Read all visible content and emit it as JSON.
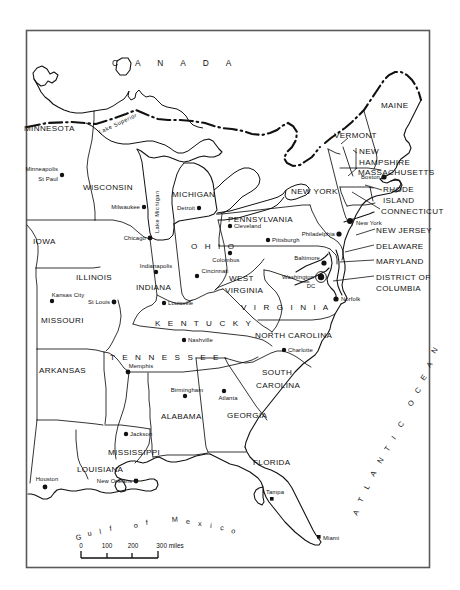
{
  "map": {
    "title": "Eastern United States reference map",
    "frame": {
      "x": 26,
      "y": 30,
      "width": 404,
      "height": 538
    },
    "country_label": "C A N A D A",
    "ocean_label": "ATLANTIC OCEAN",
    "gulf_label": "Gulf of Mexico",
    "colors": {
      "ink": "#111111",
      "frame": "#5a5a5a",
      "background": "#ffffff"
    },
    "lakes": [
      {
        "name": "Lake Superior",
        "label": "Lake Superior"
      },
      {
        "name": "Lake Michigan",
        "label": "Lake Michigan"
      }
    ],
    "states": [
      {
        "label": "MINNESOTA",
        "x": 62,
        "y": 128
      },
      {
        "label": "WISCONSIN",
        "x": 88,
        "y": 185
      },
      {
        "label": "MICHIGAN",
        "x": 172,
        "y": 196
      },
      {
        "label": "IOWA",
        "x": 38,
        "y": 238
      },
      {
        "label": "ILLINOIS",
        "x": 100,
        "y": 278
      },
      {
        "label": "INDIANA",
        "x": 160,
        "y": 285
      },
      {
        "label": "OHIO",
        "x": 198,
        "y": 250
      },
      {
        "label": "MISSOURI",
        "x": 62,
        "y": 320
      },
      {
        "label": "KENTUCKY",
        "x": 160,
        "y": 322
      },
      {
        "label": "WEST VIRGINIA",
        "x": 242,
        "y": 282
      },
      {
        "label": "VIRGINIA",
        "x": 255,
        "y": 307
      },
      {
        "label": "ARKANSAS",
        "x": 62,
        "y": 370
      },
      {
        "label": "TENNESSEE",
        "x": 134,
        "y": 358
      },
      {
        "label": "NORTH CAROLINA",
        "x": 260,
        "y": 337
      },
      {
        "label": "SOUTH CAROLINA",
        "x": 262,
        "y": 375
      },
      {
        "label": "MISSISSIPPI",
        "x": 112,
        "y": 452
      },
      {
        "label": "ALABAMA",
        "x": 162,
        "y": 420
      },
      {
        "label": "GEORGIA",
        "x": 229,
        "y": 417
      },
      {
        "label": "LOUISIANA",
        "x": 88,
        "y": 471
      },
      {
        "label": "FLORIDA",
        "x": 262,
        "y": 464
      },
      {
        "label": "PENNSYLVANIA",
        "x": 258,
        "y": 219
      },
      {
        "label": "NEW YORK",
        "x": 303,
        "y": 195
      },
      {
        "label": "MAINE",
        "x": 393,
        "y": 107
      },
      {
        "label": "VERMONT",
        "x": 352,
        "y": 135
      },
      {
        "label": "NEW HAMPSHIRE",
        "x": 368,
        "y": 152
      },
      {
        "label": "MASSACHUSETTS",
        "x": 371,
        "y": 170
      },
      {
        "label": "RHODE ISLAND",
        "x": 398,
        "y": 190
      },
      {
        "label": "CONNECTICUT",
        "x": 391,
        "y": 212
      },
      {
        "label": "NEW JERSEY",
        "x": 383,
        "y": 232
      },
      {
        "label": "DELAWARE",
        "x": 381,
        "y": 248
      },
      {
        "label": "MARYLAND",
        "x": 381,
        "y": 263
      },
      {
        "label": "DISTRICT OF COLUMBIA",
        "x": 381,
        "y": 278
      }
    ],
    "cities": [
      {
        "label": "Minneapolis",
        "dot_x": 61,
        "dot_y": 175
      },
      {
        "label": "St Paul",
        "dot_x": 61,
        "dot_y": 175
      },
      {
        "label": "Milwaukee",
        "dot_x": 144,
        "dot_y": 206
      },
      {
        "label": "Chicago",
        "dot_x": 149,
        "dot_y": 238
      },
      {
        "label": "Detroit",
        "dot_x": 198,
        "dot_y": 207
      },
      {
        "label": "Cleveland",
        "dot_x": 229,
        "dot_y": 226
      },
      {
        "label": "Pittsburgh",
        "dot_x": 271,
        "dot_y": 239
      },
      {
        "label": "Indianapolis",
        "dot_x": 155,
        "dot_y": 272
      },
      {
        "label": "Colombus",
        "dot_x": 232,
        "dot_y": 256
      },
      {
        "label": "Cincinnati",
        "dot_x": 203,
        "dot_y": 272
      },
      {
        "label": "Louisville",
        "dot_x": 164,
        "dot_y": 303
      },
      {
        "label": "Kansas City",
        "dot_x": 52,
        "dot_y": 300
      },
      {
        "label": "St Louis",
        "dot_x": 115,
        "dot_y": 300
      },
      {
        "label": "Nashville",
        "dot_x": 185,
        "dot_y": 340
      },
      {
        "label": "Memphis",
        "dot_x": 128,
        "dot_y": 371
      },
      {
        "label": "Birmingham",
        "dot_x": 185,
        "dot_y": 395
      },
      {
        "label": "Atlanta",
        "dot_x": 224,
        "dot_y": 392
      },
      {
        "label": "Charlotte",
        "dot_x": 284,
        "dot_y": 350
      },
      {
        "label": "Jackson",
        "dot_x": 126,
        "dot_y": 434
      },
      {
        "label": "Houston",
        "dot_x": 44,
        "dot_y": 488
      },
      {
        "label": "New Orleans",
        "dot_x": 136,
        "dot_y": 481
      },
      {
        "label": "Tampa",
        "dot_x": 272,
        "dot_y": 494
      },
      {
        "label": "Miami",
        "dot_x": 320,
        "dot_y": 537
      },
      {
        "label": "Norfolk",
        "dot_x": 339,
        "dot_y": 299
      },
      {
        "label": "Washington DC",
        "dot_x": 318,
        "dot_y": 277
      },
      {
        "label": "Baltimore",
        "dot_x": 322,
        "dot_y": 259
      },
      {
        "label": "Philadelphia",
        "dot_x": 338,
        "dot_y": 234
      },
      {
        "label": "New York",
        "dot_x": 353,
        "dot_y": 221
      },
      {
        "label": "Boston",
        "dot_x": 382,
        "dot_y": 177
      }
    ],
    "city_labels": {
      "minneapolis": "Minneapolis",
      "st_paul": "St Paul",
      "milwaukee": "Milwaukee",
      "chicago": "Chicago",
      "detroit": "Detroit",
      "cleveland": "Cleveland",
      "pittsburgh": "Pittsburgh",
      "indianapolis": "Indianapolis",
      "columbus": "Colombus",
      "cincinnati": "Cincinnati",
      "louisville": "Louisville",
      "kansas_city": "Kansas City",
      "st_louis": "St Louis",
      "nashville": "Nashville",
      "memphis": "Memphis",
      "birmingham": "Birmingham",
      "atlanta": "Atlanta",
      "charlotte": "Charlotte",
      "jackson": "Jackson",
      "houston": "Houston",
      "new_orleans": "New Orleans",
      "tampa": "Tampa",
      "miami": "Miami",
      "norfolk": "Norfolk",
      "washington": "Washington",
      "dc": "DC",
      "baltimore": "Baltimore",
      "philadelphia": "Philadelphia",
      "new_york": "New York",
      "boston": "Boston"
    },
    "state_labels": {
      "minnesota": "MINNESOTA",
      "wisconsin": "WISCONSIN",
      "michigan": "MICHIGAN",
      "iowa": "IOWA",
      "illinois": "ILLINOIS",
      "indiana": "INDIANA",
      "ohio": "O H I O",
      "missouri": "MISSOURI",
      "kentucky": "K E N T U C K Y",
      "west": "WEST",
      "virginia_wv": "VIRGINIA",
      "virginia": "V I R G I N I A",
      "arkansas": "ARKANSAS",
      "tennessee": "T E N N E S S E E",
      "north_carolina": "NORTH CAROLINA",
      "south": "SOUTH",
      "carolina": "CAROLINA",
      "mississippi": "MISSISSIPPI",
      "alabama": "ALABAMA",
      "georgia": "GEORGIA",
      "louisiana": "LOUISIANA",
      "florida": "FLORIDA",
      "pennsylvania": "PENNSYLVANIA",
      "new_york_state": "NEW YORK",
      "maine": "MAINE",
      "vermont": "VERMONT",
      "new": "NEW",
      "hampshire": "HAMPSHIRE",
      "massachusetts": "MASSACHUSETTS",
      "rhode": "RHODE",
      "island": "ISLAND",
      "connecticut": "CONNECTICUT",
      "new_jersey": "NEW JERSEY",
      "delaware": "DELAWARE",
      "maryland": "MARYLAND",
      "district_of": "DISTRICT OF",
      "columbia": "COLUMBIA"
    },
    "water_labels": {
      "lake_superior": "Lake Superior",
      "lake_michigan": "Lake Michigan",
      "canada": "C A N A D A",
      "gulf_g": "G",
      "gulf_u": "u",
      "gulf_l": "l",
      "gulf_f": "f",
      "gulf_o": "o",
      "gulf_f2": "f",
      "gulf_m": "M",
      "gulf_e": "e",
      "gulf_x": "x",
      "gulf_i": "i",
      "gulf_c": "c",
      "gulf_o2": "o",
      "atlantic": "ATLANTIC",
      "ocean": "OCEAN"
    },
    "scale": {
      "ticks": [
        "0",
        "100",
        "200",
        "300 miles"
      ],
      "tick_0": "0",
      "tick_100": "100",
      "tick_200": "200",
      "tick_300": "300 miles",
      "unit": "miles"
    },
    "caption": ""
  }
}
